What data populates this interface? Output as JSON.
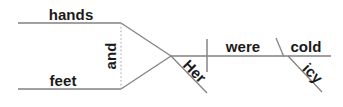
{
  "diagram": {
    "type": "reed-kellogg-sentence-diagram",
    "sentence": "Her hands and feet were cold, icy.",
    "canvas": {
      "width": 343,
      "height": 107,
      "background": "#ffffff"
    },
    "colors": {
      "line": "#808080",
      "dotted_line": "#b0b0b0",
      "text": "#1a1a1a"
    },
    "words": {
      "compound_subject_top": "hands",
      "compound_subject_bottom": "feet",
      "conjunction": "and",
      "modifier_subject": "Her",
      "verb": "were",
      "predicate_adjective": "cold",
      "predicate_adjective_modifier": "icy"
    },
    "lines": {
      "subject_top_baseline": {
        "x1": 18,
        "y1": 23,
        "x2": 121,
        "y2": 23
      },
      "subject_bottom_baseline": {
        "x1": 18,
        "y1": 89,
        "x2": 121,
        "y2": 89
      },
      "conjunction_dotted": {
        "x1": 121,
        "y1": 23,
        "x2": 121,
        "y2": 89
      },
      "top_branch": {
        "x1": 121,
        "y1": 23,
        "x2": 171,
        "y2": 56
      },
      "bottom_branch": {
        "x1": 121,
        "y1": 89,
        "x2": 171,
        "y2": 56
      },
      "main_baseline": {
        "x1": 171,
        "y1": 56,
        "x2": 331,
        "y2": 56
      },
      "subject_verb_divider": {
        "x1": 207,
        "y1": 39,
        "x2": 207,
        "y2": 72
      },
      "modifier_her_slant": {
        "x1": 171,
        "y1": 56,
        "x2": 207,
        "y2": 93
      },
      "predicate_adjective_divider": {
        "x1": 276,
        "y1": 38,
        "x2": 284,
        "y2": 57
      },
      "modifier_icy_slant": {
        "x1": 288,
        "y1": 56,
        "x2": 322,
        "y2": 92
      }
    },
    "label_positions": {
      "hands": {
        "x": 71,
        "y": 20,
        "rotation": 0,
        "anchor": "middle"
      },
      "feet": {
        "x": 63,
        "y": 86,
        "rotation": 0,
        "anchor": "middle"
      },
      "and": {
        "x": 116,
        "y": 56,
        "rotation": -90,
        "anchor": "middle"
      },
      "Her": {
        "x": 190,
        "y": 74,
        "rotation": 45,
        "anchor": "middle"
      },
      "were": {
        "x": 243,
        "y": 52,
        "rotation": 0,
        "anchor": "middle"
      },
      "cold": {
        "x": 306,
        "y": 52,
        "rotation": 0,
        "anchor": "middle"
      },
      "icy": {
        "x": 309,
        "y": 76,
        "rotation": 45,
        "anchor": "middle"
      }
    }
  }
}
